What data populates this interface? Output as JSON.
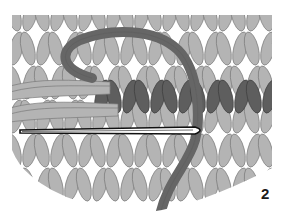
{
  "figure": {
    "step_number": "2",
    "colors": {
      "background": "#ffffff",
      "stitch_light": "#b4b4b4",
      "stitch_outline": "#7a7a7a",
      "stitch_dark": "#5e5e5e",
      "working_yarn": "#666666",
      "needle_outline": "#111111",
      "needle_fill": "#ffffff"
    }
  }
}
